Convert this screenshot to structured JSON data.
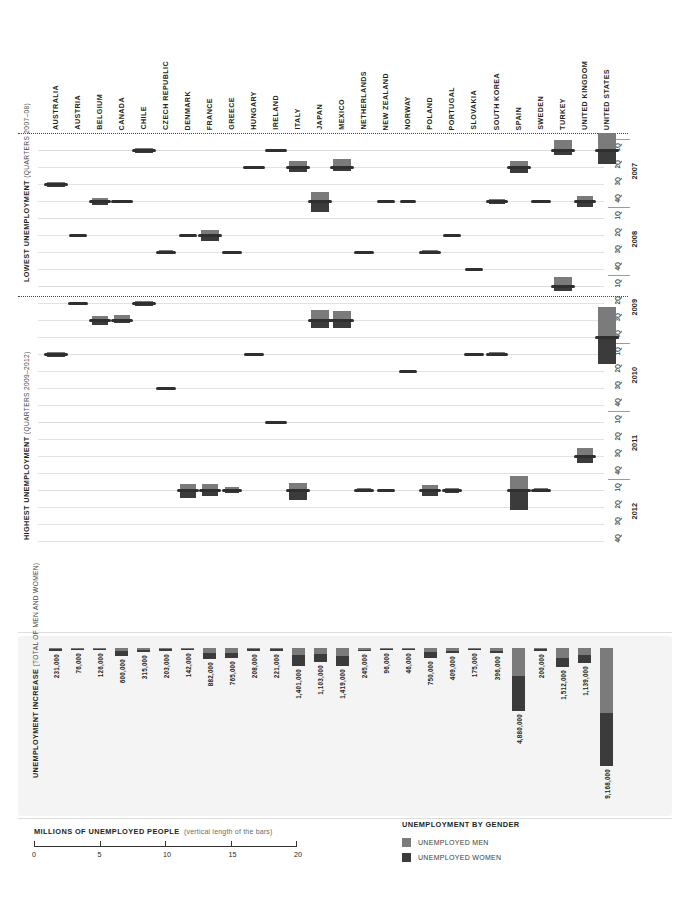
{
  "colors": {
    "men": "#7b7b7b",
    "women": "#3b3b3b",
    "grid": "#e2e2e2",
    "text": "#231f20"
  },
  "countries": [
    "AUSTRALIA",
    "AUSTRIA",
    "BELGIUM",
    "CANADA",
    "CHILE",
    "CZECH REPUBLIC",
    "DENMARK",
    "FRANCE",
    "GREECE",
    "HUNGARY",
    "IRELAND",
    "ITALY",
    "JAPAN",
    "MEXICO",
    "NETHERLANDS",
    "NEW ZEALAND",
    "NORWAY",
    "POLAND",
    "PORTUGAL",
    "SLOVAKIA",
    "SOUTH KOREA",
    "SPAIN",
    "SWEDEN",
    "TURKEY",
    "UNITED KINGDOM",
    "UNITED STATES"
  ],
  "side_titles": {
    "lowest": {
      "title": "LOWEST UNEMPLOYMENT",
      "sub": "(QUARTERS 2007–08)"
    },
    "highest": {
      "title": "HIGHEST UNEMPLOYMENT",
      "sub": "(QUARTERS 2009–2012)"
    }
  },
  "timeline": {
    "years": [
      "2007",
      "2008",
      "2009",
      "2010",
      "2011",
      "2012"
    ],
    "quarters": [
      "1Q",
      "2Q",
      "3Q",
      "4Q"
    ]
  },
  "increase_panel": {
    "title": "UNEMPLOYMENT INCREASE",
    "sub": "(TOTAL OF MEN AND WOMEN)"
  },
  "footer": {
    "scale_title": "MILLIONS OF UNEMPLOYED PEOPLE",
    "scale_sub": "(vertical length of the bars)",
    "scale_ticks": [
      "0",
      "5",
      "10",
      "15",
      "20"
    ],
    "legend_title": "UNEMPLOYMENT BY GENDER",
    "legend_men": "UNEMPLOYED MEN",
    "legend_women": "UNEMPLOYED WOMEN"
  },
  "chart_data": {
    "type": "bar",
    "xlabel": "",
    "ylabel": "Quarters 2007–2012",
    "legend": [
      "UNEMPLOYED MEN",
      "UNEMPLOYED WOMEN"
    ],
    "scale_note": "Vertical length of the bars = millions of unemployed people, 0–20 scale",
    "categories": [
      "AUSTRALIA",
      "AUSTRIA",
      "BELGIUM",
      "CANADA",
      "CHILE",
      "CZECH REPUBLIC",
      "DENMARK",
      "FRANCE",
      "GREECE",
      "HUNGARY",
      "IRELAND",
      "ITALY",
      "JAPAN",
      "MEXICO",
      "NETHERLANDS",
      "NEW ZEALAND",
      "NORWAY",
      "POLAND",
      "PORTUGAL",
      "SLOVAKIA",
      "SOUTH KOREA",
      "SPAIN",
      "SWEDEN",
      "TURKEY",
      "UNITED KINGDOM",
      "UNITED STATES"
    ],
    "unemployment_increase": [
      231000,
      76000,
      126000,
      600000,
      315000,
      203000,
      142000,
      882000,
      765000,
      208000,
      221000,
      1401000,
      1103000,
      1419000,
      245000,
      96000,
      46000,
      750000,
      409000,
      175000,
      396000,
      4880000,
      200000,
      1512000,
      1139000,
      9168000
    ],
    "lowest_quarter": [
      "2007 3Q",
      "2008 2Q",
      "2007 4Q",
      "2007 4Q",
      "2007 1Q",
      "2008 3Q",
      "2008 2Q",
      "2008 2Q",
      "2008 3Q",
      "2007 2Q",
      "2007 1Q",
      "2007 2Q",
      "2007 4Q",
      "2007 2Q",
      "2008 3Q",
      "2007 4Q",
      "2007 4Q",
      "2008 3Q",
      "2008 2Q",
      "2008 4Q",
      "2007 4Q",
      "2007 2Q",
      "2007 4Q",
      "2007 1Q",
      "2007 4Q",
      "2007 1Q"
    ],
    "highest_quarter": [
      "2010 1Q",
      "2009 2Q",
      "2009 3Q",
      "2009 3Q",
      "2009 2Q",
      "2010 3Q",
      "2012 1Q",
      "2012 1Q",
      "2012 1Q",
      "2010 1Q",
      "2011 1Q",
      "2012 1Q",
      "2009 3Q",
      "2009 3Q",
      "2012 1Q",
      "2012 1Q",
      "2010 2Q",
      "2012 1Q",
      "2012 1Q",
      "2010 1Q",
      "2010 1Q",
      "2012 1Q",
      "2012 1Q",
      "2009 1Q",
      "2011 4Q",
      "2009 4Q"
    ],
    "series": [
      {
        "name": "UNEMPLOYED MEN",
        "color": "#7b7b7b"
      },
      {
        "name": "UNEMPLOYED WOMEN",
        "color": "#3b3b3b"
      }
    ]
  }
}
